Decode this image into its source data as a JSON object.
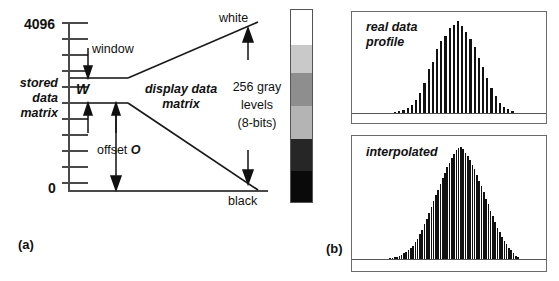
{
  "figure": {
    "panel_a_label": "(a)",
    "panel_b_label": "(b)"
  },
  "panel_a": {
    "axis": {
      "max_label": "4096",
      "min_label": "0",
      "tick_count": 11
    },
    "labels": {
      "stored_data_matrix": "stored\ndata\nmatrix",
      "stored_line1": "stored",
      "stored_line2": "data",
      "stored_line3": "matrix",
      "window": "window",
      "window_symbol": "W",
      "offset": "offset ",
      "offset_symbol": "O",
      "display_data_matrix_line1": "display data",
      "display_data_matrix_line2": "matrix",
      "white": "white",
      "black": "black",
      "gray_levels_line1": "256 gray",
      "gray_levels_line2": "levels",
      "gray_levels_line3": "(8-bits)"
    },
    "colors": {
      "axis": "#4a4a4a",
      "ramp": "#1a1a1a",
      "text": "#111111"
    }
  },
  "grayscale_bar": {
    "name": "grayscale-ramp",
    "bands": [
      {
        "label": "white",
        "color": "#ffffff",
        "height_pct": 18
      },
      {
        "label": "light-gray",
        "color": "#c9c9c9",
        "height_pct": 15
      },
      {
        "label": "mid-gray",
        "color": "#8e8e8e",
        "height_pct": 17
      },
      {
        "label": "gray",
        "color": "#b4b4b4",
        "height_pct": 17
      },
      {
        "label": "dark-gray",
        "color": "#262626",
        "height_pct": 17
      },
      {
        "label": "black",
        "color": "#0a0a0a",
        "height_pct": 16
      }
    ]
  },
  "chart_data": [
    {
      "type": "bar",
      "name": "real-data-profile",
      "title": "real data profile",
      "title_line1": "real data",
      "title_line2": "profile",
      "xlabel": "",
      "ylabel": "",
      "grid": false,
      "legend": "none",
      "ylim": [
        0,
        100
      ],
      "bar_count": 29,
      "categories": [
        "1",
        "2",
        "3",
        "4",
        "5",
        "6",
        "7",
        "8",
        "9",
        "10",
        "11",
        "12",
        "13",
        "14",
        "15",
        "16",
        "17",
        "18",
        "19",
        "20",
        "21",
        "22",
        "23",
        "24",
        "25",
        "26",
        "27",
        "28",
        "29"
      ],
      "values": [
        1,
        2,
        3,
        5,
        9,
        14,
        22,
        33,
        48,
        55,
        70,
        78,
        84,
        92,
        96,
        100,
        95,
        88,
        80,
        72,
        60,
        50,
        38,
        27,
        18,
        11,
        7,
        4,
        2
      ]
    },
    {
      "type": "bar",
      "name": "interpolated-profile",
      "title": "interpolated",
      "title_line1": "interpolated",
      "xlabel": "",
      "ylabel": "",
      "grid": false,
      "legend": "none",
      "ylim": [
        0,
        100
      ],
      "bar_count": 57,
      "categories": [
        "1",
        "2",
        "3",
        "4",
        "5",
        "6",
        "7",
        "8",
        "9",
        "10",
        "11",
        "12",
        "13",
        "14",
        "15",
        "16",
        "17",
        "18",
        "19",
        "20",
        "21",
        "22",
        "23",
        "24",
        "25",
        "26",
        "27",
        "28",
        "29",
        "30",
        "31",
        "32",
        "33",
        "34",
        "35",
        "36",
        "37",
        "38",
        "39",
        "40",
        "41",
        "42",
        "43",
        "44",
        "45",
        "46",
        "47",
        "48",
        "49",
        "50",
        "51",
        "52",
        "53",
        "54",
        "55",
        "56",
        "57"
      ],
      "values": [
        1,
        1,
        2,
        2,
        3,
        4,
        5,
        6,
        8,
        10,
        12,
        15,
        18,
        22,
        26,
        31,
        36,
        41,
        46,
        52,
        57,
        62,
        67,
        72,
        77,
        82,
        86,
        90,
        94,
        97,
        99,
        100,
        98,
        95,
        92,
        88,
        84,
        80,
        75,
        70,
        65,
        60,
        54,
        49,
        43,
        38,
        33,
        28,
        24,
        20,
        16,
        13,
        10,
        8,
        5,
        3,
        2
      ]
    }
  ]
}
